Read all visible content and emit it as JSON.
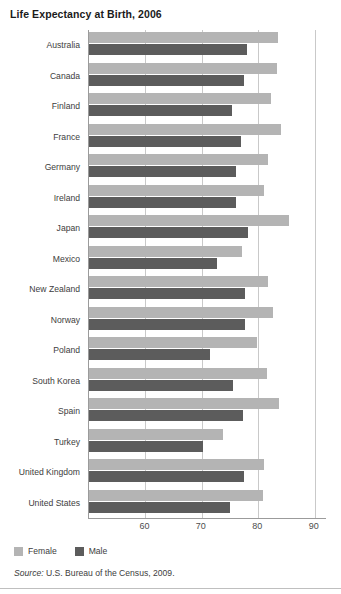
{
  "title": "Life Expectancy at Birth, 2006",
  "legend": {
    "female_label": "Female",
    "male_label": "Male",
    "female_color": "#b4b4b4",
    "male_color": "#5c5c5c"
  },
  "source": {
    "prefix": "Source:",
    "text": "U.S. Bureau of the Census, 2009."
  },
  "chart_data": {
    "type": "bar",
    "orientation": "horizontal",
    "title": "Life Expectancy at Birth, 2006",
    "xlabel": "",
    "ylabel": "",
    "xlim": [
      50,
      92
    ],
    "xticks": [
      60,
      70,
      80,
      90
    ],
    "grid": true,
    "legend_position": "bottom-left",
    "categories": [
      "Australia",
      "Canada",
      "Finland",
      "France",
      "Germany",
      "Ireland",
      "Japan",
      "Mexico",
      "New Zealand",
      "Norway",
      "Poland",
      "South Korea",
      "Spain",
      "Turkey",
      "United Kingdom",
      "United States"
    ],
    "series": [
      {
        "name": "Female",
        "color": "#b4b4b4",
        "values": [
          83.5,
          83.3,
          82.2,
          84.0,
          81.8,
          81.1,
          85.5,
          77.2,
          81.8,
          82.6,
          79.7,
          81.5,
          83.6,
          73.7,
          81.0,
          80.8
        ]
      },
      {
        "name": "Male",
        "color": "#5c5c5c",
        "values": [
          78.0,
          77.5,
          75.4,
          77.0,
          76.1,
          76.1,
          78.1,
          72.6,
          77.7,
          77.6,
          71.5,
          75.6,
          77.3,
          70.2,
          77.4,
          75.0
        ]
      }
    ]
  }
}
